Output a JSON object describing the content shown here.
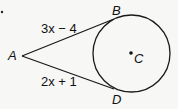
{
  "diagram": {
    "points": {
      "A": {
        "label": "A",
        "x": 22,
        "y": 56
      },
      "B": {
        "label": "B",
        "x": 114,
        "y": 20
      },
      "C": {
        "label": "C",
        "x": 131.5,
        "y": 53.5
      },
      "D": {
        "label": "D",
        "x": 114,
        "y": 89
      }
    },
    "circle": {
      "cx": 131.5,
      "cy": 53.5,
      "r": 38.5
    },
    "segments": {
      "AB": {
        "label": "3x − 4"
      },
      "AD": {
        "label": "2x + 1"
      }
    },
    "colors": {
      "stroke": "#1a1a1a",
      "background": "#f7f7f5"
    }
  }
}
